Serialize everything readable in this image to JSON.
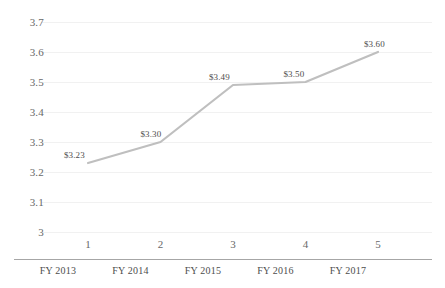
{
  "chart_data": {
    "type": "line",
    "title": "",
    "subtitle": "",
    "xlabel": "",
    "ylabel": "",
    "categories": [
      "FY 2013",
      "FY 2014",
      "FY 2015",
      "FY 2016",
      "FY 2017"
    ],
    "x": [
      1,
      2,
      3,
      4,
      5
    ],
    "x_index_labels": [
      "1",
      "2",
      "3",
      "4",
      "5"
    ],
    "values": [
      3.23,
      3.3,
      3.49,
      3.5,
      3.6
    ],
    "point_labels": [
      "$3.23",
      "$3.30",
      "$3.49",
      "$3.50",
      "$3.60"
    ],
    "ylim": [
      3.0,
      3.7
    ],
    "ytick_labels": [
      "3.7",
      "3.6",
      "3.5",
      "3.4",
      "3.3",
      "3.2",
      "3.1",
      "3"
    ],
    "ytick_values": [
      3.7,
      3.6,
      3.5,
      3.4,
      3.3,
      3.2,
      3.1,
      3.0
    ],
    "grid": true,
    "legend": false,
    "series": [
      {
        "name": "",
        "values": [
          3.23,
          3.3,
          3.49,
          3.5,
          3.6
        ],
        "color": "#bfbfbf"
      }
    ],
    "colors": {
      "line": "#bfbfbf",
      "gridline": "#f1f1f1",
      "axis": "#a6a6a6",
      "tick_text": "#686868",
      "label_text": "#4d4d4d",
      "background": "#ffffff"
    }
  }
}
